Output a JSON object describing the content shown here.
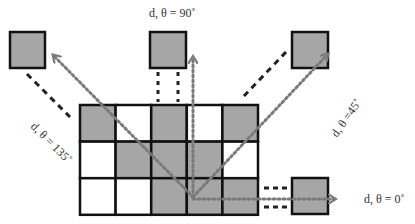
{
  "diagram": {
    "title": "",
    "colors": {
      "filled": "#a6a6a6",
      "empty": "#ffffff",
      "stroke": "#111111",
      "dotted_arrow": "#7a7a7a",
      "dashed_line": "#222222"
    },
    "grid": {
      "cols": 5,
      "rows": 3,
      "cells": [
        [
          "gray",
          "white",
          "gray",
          "white",
          "gray"
        ],
        [
          "white",
          "gray",
          "gray",
          "gray",
          "white"
        ],
        [
          "white",
          "white",
          "gray",
          "gray",
          "gray"
        ]
      ]
    },
    "labels": {
      "deg90": "d, θ = 90˚",
      "deg135": "d, θ = 135˚",
      "deg45": "d, θ =45˚",
      "deg0": "d, θ = 0˚"
    },
    "neighbor_boxes": [
      {
        "name": "neighbor-135",
        "direction": "135"
      },
      {
        "name": "neighbor-90",
        "direction": "90"
      },
      {
        "name": "neighbor-45",
        "direction": "45"
      },
      {
        "name": "neighbor-0",
        "direction": "0"
      }
    ]
  }
}
